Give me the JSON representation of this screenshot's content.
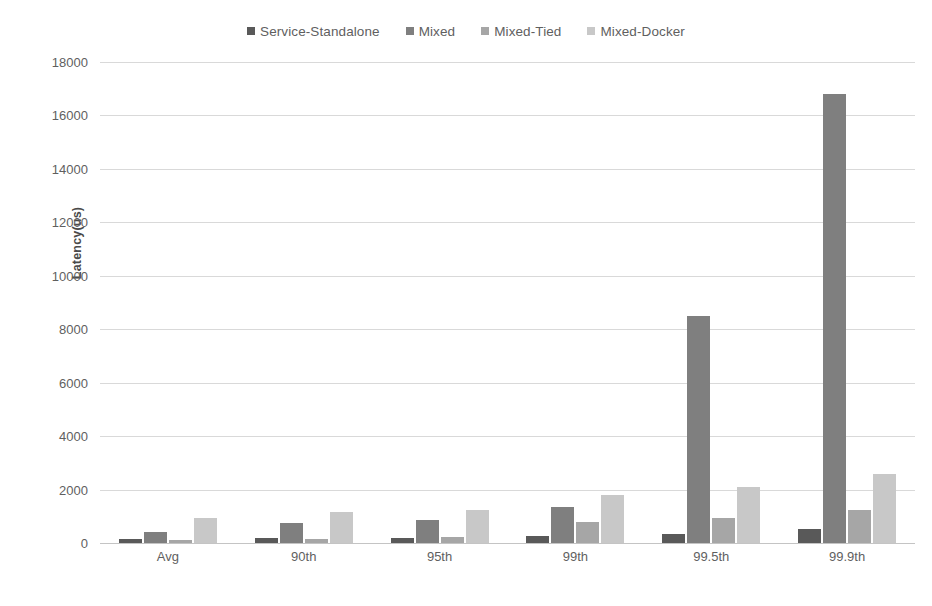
{
  "chart_data": {
    "type": "bar",
    "title": "",
    "subtitle": "",
    "xlabel": "",
    "ylabel": "Latency(us)",
    "ylim": [
      0,
      18000
    ],
    "ytick_step": 2000,
    "ytick_labels": [
      "18000",
      "16000",
      "14000",
      "12000",
      "10000",
      "8000",
      "6000",
      "4000",
      "2000",
      "0"
    ],
    "ytick_values": [
      18000,
      16000,
      14000,
      12000,
      10000,
      8000,
      6000,
      4000,
      2000,
      0
    ],
    "grid": true,
    "legend_position": "top-center",
    "categories": [
      "Avg",
      "90th",
      "95th",
      "99th",
      "99.5th",
      "99.9th"
    ],
    "series": [
      {
        "name": "Service-Standalone",
        "color": "#595959",
        "values": [
          150,
          170,
          200,
          280,
          330,
          530
        ]
      },
      {
        "name": "Mixed",
        "color": "#7f7f7f",
        "values": [
          400,
          750,
          880,
          1350,
          8500,
          16800
        ]
      },
      {
        "name": "Mixed-Tied",
        "color": "#a6a6a6",
        "values": [
          100,
          160,
          210,
          800,
          950,
          1250
        ]
      },
      {
        "name": "Mixed-Docker",
        "color": "#c8c8c8",
        "values": [
          950,
          1150,
          1250,
          1800,
          2100,
          2600
        ]
      }
    ]
  },
  "colors": {
    "gridline": "#d9d9d9",
    "axis": "#c4c4c4",
    "text": "#5f5f5f",
    "background": "#ffffff"
  }
}
